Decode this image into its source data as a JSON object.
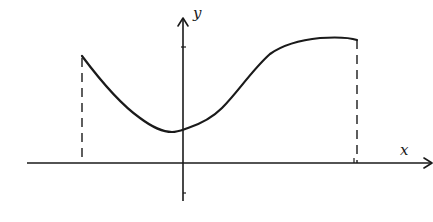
{
  "diagram": {
    "axes": {
      "x_label": "x",
      "y_label": "y"
    },
    "colors": {
      "stroke": "#1a1a1a",
      "background": "#ffffff"
    },
    "curve": {
      "description": "Smooth function graph on a closed interval: starts high at left endpoint, decreases to a minimum slightly left of the y-axis, then increases and levels off to a maximum at the right endpoint",
      "left_endpoint": {
        "px": [
          82,
          56
        ]
      },
      "minimum": {
        "px": [
          170,
          132
        ]
      },
      "y_intercept": {
        "px": [
          183,
          129
        ]
      },
      "right_endpoint": {
        "px": [
          357,
          38
        ]
      }
    },
    "dashed_guides": [
      {
        "name": "left-endpoint-guide",
        "from_px": [
          82,
          56
        ],
        "to_px": [
          82,
          163
        ]
      },
      {
        "name": "right-endpoint-guide",
        "from_px": [
          357,
          38
        ],
        "to_px": [
          357,
          163
        ]
      }
    ]
  }
}
